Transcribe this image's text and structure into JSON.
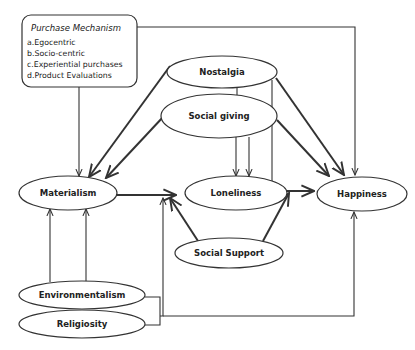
{
  "diagram": {
    "purchase_box": {
      "title": "Purchase Mechanism",
      "items": [
        "a.Egocentric",
        "b.Socio-centric",
        "c.Experiential purchases",
        "d.Product Evaluations"
      ]
    },
    "nodes": {
      "nostalgia": "Nostalgia",
      "social_giving": "Social giving",
      "materialism": "Materialism",
      "loneliness": "Loneliness",
      "happiness": "Happiness",
      "social_support": "Social Support",
      "environmentalism": "Environmentalism",
      "religiosity": "Religiosity"
    },
    "edges": [
      {
        "from": "Purchase Mechanism",
        "to": "Materialism"
      },
      {
        "from": "Purchase Mechanism",
        "to": "Happiness"
      },
      {
        "from": "Nostalgia",
        "to": "Materialism"
      },
      {
        "from": "Nostalgia",
        "to": "Loneliness"
      },
      {
        "from": "Nostalgia",
        "to": "Happiness"
      },
      {
        "from": "Nostalgia",
        "to": "Loneliness-Happiness path"
      },
      {
        "from": "Social giving",
        "to": "Materialism"
      },
      {
        "from": "Social giving",
        "to": "Loneliness"
      },
      {
        "from": "Social giving",
        "to": "Happiness"
      },
      {
        "from": "Materialism",
        "to": "Loneliness"
      },
      {
        "from": "Loneliness",
        "to": "Happiness"
      },
      {
        "from": "Social Support",
        "to": "Materialism-Loneliness path"
      },
      {
        "from": "Social Support",
        "to": "Loneliness-Happiness path"
      },
      {
        "from": "Environmentalism",
        "to": "Materialism"
      },
      {
        "from": "Environmentalism",
        "to": "Materialism-Loneliness path"
      },
      {
        "from": "Religiosity",
        "to": "Happiness"
      }
    ]
  }
}
